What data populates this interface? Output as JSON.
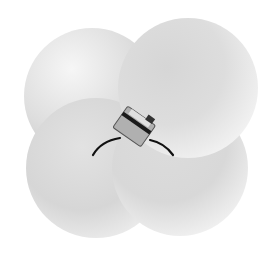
{
  "image": {
    "description": "Four overlapping gray spheres arranged in a 2x2 cluster with a small sensor device and two cables at the center",
    "background_color": "#ffffff",
    "spheres": [
      {
        "name": "top-left",
        "cx": 92,
        "cy": 96,
        "r": 68,
        "light": "#f4f4f4",
        "dark": "#c9c9c9"
      },
      {
        "name": "bottom-left",
        "cx": 96,
        "cy": 168,
        "r": 70,
        "light": "#f2f2f2",
        "dark": "#c6c6c6"
      },
      {
        "name": "bottom-right",
        "cx": 180,
        "cy": 168,
        "r": 68,
        "light": "#f2f2f2",
        "dark": "#c8c8c8"
      },
      {
        "name": "top-right",
        "cx": 188,
        "cy": 88,
        "r": 70,
        "light": "#f6f6f6",
        "dark": "#cbcbcb"
      }
    ],
    "device": {
      "body_color": "#a8a8a8",
      "stripe_color": "#1a1a1a",
      "cable_color": "#111111"
    }
  }
}
